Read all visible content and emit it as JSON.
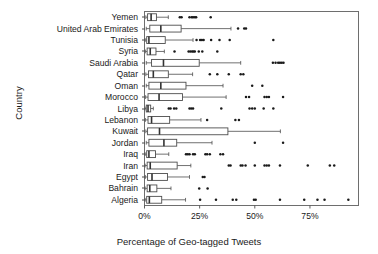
{
  "chart_data": {
    "type": "box",
    "title": "",
    "xlabel": "Percentage of Geo-tagged Tweets",
    "ylabel": "Country",
    "xlim": [
      0,
      97
    ],
    "xticks": [
      0,
      25,
      50,
      75
    ],
    "xtick_labels": [
      "0%",
      "25%",
      "50%",
      "75%"
    ],
    "grid": false,
    "legend": "none",
    "orientation": "horizontal",
    "categories": [
      "Yemen",
      "United Arab Emirates",
      "Tunisia",
      "Syria",
      "Saudi Arabia",
      "Qatar",
      "Oman",
      "Morocco",
      "Libya",
      "Lebanon",
      "Kuwait",
      "Jordan",
      "Iraq",
      "Iran",
      "Egypt",
      "Bahrain",
      "Algeria"
    ],
    "boxes": [
      {
        "category": "Yemen",
        "whisker_low": 0.6,
        "q1": 1.4,
        "median": 3.0,
        "q3": 5.4,
        "whisker_high": 10.8,
        "outliers": [
          16.0,
          16.8,
          20.4,
          21.4,
          22.0,
          22.8,
          23.4,
          30.0
        ]
      },
      {
        "category": "United Arab Emirates",
        "whisker_low": 0.8,
        "q1": 2.4,
        "median": 7.4,
        "q3": 16.6,
        "whisker_high": 39.2,
        "outliers": [
          42.4,
          45.2,
          46.0
        ]
      },
      {
        "category": "Tunisia",
        "whisker_low": 0.3,
        "q1": 1.0,
        "median": 2.0,
        "q3": 9.4,
        "whisker_high": 22.0,
        "outliers": [
          23.6,
          25.2,
          26.0,
          26.8,
          30.2,
          34.0,
          38.6,
          58.4
        ]
      },
      {
        "category": "Syria",
        "whisker_low": 0.4,
        "q1": 1.2,
        "median": 2.6,
        "q3": 5.2,
        "whisker_high": 9.0,
        "outliers": [
          13.6,
          20.0,
          20.8,
          21.6,
          22.2,
          22.8,
          24.6,
          26.2,
          33.0
        ]
      },
      {
        "category": "Saudi Arabia",
        "whisker_low": 0.8,
        "q1": 3.2,
        "median": 8.6,
        "q3": 24.8,
        "whisker_high": 43.6,
        "outliers": [
          58.2,
          59.4,
          60.6,
          61.4,
          62.2,
          63.0
        ]
      },
      {
        "category": "Qatar",
        "whisker_low": 0.6,
        "q1": 1.8,
        "median": 4.0,
        "q3": 10.8,
        "whisker_high": 21.8,
        "outliers": [
          29.6,
          33.0,
          38.2,
          43.6,
          44.8
        ]
      },
      {
        "category": "Oman",
        "whisker_low": 0.8,
        "q1": 2.0,
        "median": 7.4,
        "q3": 18.8,
        "whisker_high": 35.6,
        "outliers": [
          48.8,
          53.4
        ]
      },
      {
        "category": "Morocco",
        "whisker_low": 0.5,
        "q1": 1.6,
        "median": 6.6,
        "q3": 17.2,
        "whisker_high": 37.0,
        "outliers": [
          46.0,
          47.4,
          54.4,
          55.4,
          56.4,
          62.8
        ]
      },
      {
        "category": "Libya",
        "whisker_low": 0.3,
        "q1": 0.8,
        "median": 1.6,
        "q3": 2.8,
        "whisker_high": 4.0,
        "outliers": [
          11.0,
          11.8,
          13.4,
          14.4,
          20.4,
          21.2,
          22.0,
          34.8,
          47.6,
          48.8,
          50.0,
          54.0,
          58.4
        ]
      },
      {
        "category": "Lebanon",
        "whisker_low": 0.4,
        "q1": 1.6,
        "median": 3.2,
        "q3": 11.4,
        "whisker_high": 25.6,
        "outliers": [
          28.4,
          41.2,
          42.8
        ]
      },
      {
        "category": "Kuwait",
        "whisker_low": 0.6,
        "q1": 1.4,
        "median": 6.8,
        "q3": 37.8,
        "whisker_high": 61.6,
        "outliers": []
      },
      {
        "category": "Jordan",
        "whisker_low": 0.8,
        "q1": 2.0,
        "median": 8.8,
        "q3": 14.6,
        "whisker_high": 30.6,
        "outliers": [
          50.0,
          62.8
        ]
      },
      {
        "category": "Iraq",
        "whisker_low": 0.3,
        "q1": 1.0,
        "median": 2.0,
        "q3": 5.0,
        "whisker_high": 11.0,
        "outliers": [
          18.8,
          19.6,
          20.4,
          22.0,
          22.8,
          27.6,
          28.4,
          29.6,
          34.4,
          35.6
        ]
      },
      {
        "category": "Iran",
        "whisker_low": 0.3,
        "q1": 1.2,
        "median": 2.6,
        "q3": 14.8,
        "whisker_high": 21.0,
        "outliers": [
          38.2,
          39.0,
          43.6,
          44.4,
          45.8,
          50.0,
          54.4,
          55.4,
          56.4,
          61.4,
          74.0,
          84.0,
          86.0
        ]
      },
      {
        "category": "Egypt",
        "whisker_low": 0.4,
        "q1": 1.4,
        "median": 3.4,
        "q3": 10.4,
        "whisker_high": 20.4,
        "outliers": [
          26.4,
          27.2
        ]
      },
      {
        "category": "Bahrain",
        "whisker_low": 0.3,
        "q1": 1.2,
        "median": 2.4,
        "q3": 5.6,
        "whisker_high": 12.0,
        "outliers": [
          24.8,
          28.6
        ]
      },
      {
        "category": "Algeria",
        "whisker_low": 0.3,
        "q1": 1.0,
        "median": 2.2,
        "q3": 7.8,
        "whisker_high": 18.6,
        "outliers": [
          25.2,
          32.4,
          40.0,
          41.6,
          49.6,
          50.4,
          61.4,
          72.4,
          78.4,
          81.6,
          92.4
        ]
      }
    ]
  },
  "style": {
    "line_color": "#4d4d4d",
    "box_fill": "#ffffff",
    "median_color": "#333333",
    "outlier_color": "#1a1a1a",
    "panel_border": "#6e6e6e",
    "background": "#ffffff"
  }
}
